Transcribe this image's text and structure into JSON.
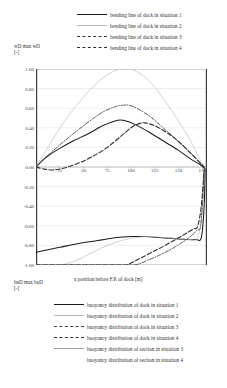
{
  "chart_data": {
    "type": "line",
    "title": "",
    "xlabel": "x position before F.P. of dock [m]",
    "ylabel_top": "wD/max wD [-]",
    "ylabel_bottom": "buD/max buD [-]",
    "xlim": [
      0,
      180
    ],
    "ylim": [
      -1.0,
      1.0
    ],
    "grid": true,
    "xticks": [
      25,
      50,
      75,
      100,
      125,
      150,
      175
    ],
    "yticks": [
      1.0,
      0.8,
      0.6,
      0.4,
      0.2,
      0.0,
      -0.2,
      -0.4,
      -0.6,
      -0.8,
      -1.0
    ],
    "ytick_labels": [
      "1.00",
      "0.80",
      "0.60",
      "0.40",
      "0.20",
      "0.00",
      "-0.20",
      "-0.40",
      "-0.60",
      "-0.80",
      "-1.00"
    ],
    "xtick_labels": [
      "25",
      "50",
      "75",
      "100",
      "125",
      "150",
      "175"
    ],
    "series": [
      {
        "name": "bending line of dock in situation 1",
        "style": "solid",
        "color": "#1a1a1a",
        "x": [
          0,
          5,
          12,
          25,
          40,
          55,
          70,
          80,
          88,
          95,
          105,
          120,
          135,
          150,
          163,
          172,
          176,
          178
        ],
        "values": [
          0.0,
          0.05,
          0.11,
          0.19,
          0.27,
          0.34,
          0.42,
          0.46,
          0.48,
          0.47,
          0.43,
          0.35,
          0.26,
          0.17,
          0.08,
          0.03,
          0.0,
          -0.02
        ]
      },
      {
        "name": "bending line of dock in situation 2",
        "style": "thin",
        "color": "#bdbdbd",
        "x": [
          0,
          6,
          15,
          28,
          42,
          58,
          72,
          85,
          95,
          100,
          110,
          122,
          136,
          150,
          162,
          172,
          177
        ],
        "values": [
          0.0,
          0.1,
          0.24,
          0.44,
          0.62,
          0.8,
          0.92,
          0.99,
          1.0,
          1.0,
          0.95,
          0.85,
          0.67,
          0.47,
          0.28,
          0.09,
          0.0
        ]
      },
      {
        "name": "bending line of dock in situation 3",
        "style": "dashdot",
        "color": "#3b3b3b",
        "x": [
          0,
          6,
          15,
          28,
          42,
          58,
          72,
          85,
          92,
          98,
          108,
          122,
          136,
          150,
          163,
          172,
          177
        ],
        "values": [
          0.0,
          0.06,
          0.14,
          0.25,
          0.36,
          0.48,
          0.57,
          0.62,
          0.63,
          0.63,
          0.59,
          0.5,
          0.38,
          0.26,
          0.14,
          0.05,
          0.0
        ]
      },
      {
        "name": "bending line of dock in situation 4",
        "style": "dashed",
        "color": "#2e2e2e",
        "x": [
          0,
          8,
          18,
          30,
          45,
          60,
          75,
          90,
          100,
          108,
          115,
          125,
          138,
          150,
          163,
          172,
          177
        ],
        "values": [
          0.0,
          -0.02,
          -0.03,
          -0.01,
          0.04,
          0.11,
          0.2,
          0.32,
          0.4,
          0.44,
          0.45,
          0.42,
          0.35,
          0.26,
          0.14,
          0.05,
          0.0
        ]
      },
      {
        "name": "buoyancy distribution of dock in situation 1",
        "style": "solid",
        "color": "#1a1a1a",
        "x": [
          0,
          10,
          25,
          45,
          65,
          85,
          100,
          115,
          130,
          145,
          158,
          168,
          174,
          177,
          178
        ],
        "values": [
          -0.87,
          -0.85,
          -0.82,
          -0.78,
          -0.75,
          -0.72,
          -0.71,
          -0.71,
          -0.72,
          -0.73,
          -0.74,
          -0.74,
          -0.72,
          -0.4,
          -0.03
        ]
      },
      {
        "name": "buoyancy distribution of dock in situation 2",
        "style": "thin",
        "color": "#bdbdbd",
        "x": [
          0,
          12,
          25,
          38,
          50,
          62,
          75,
          90,
          105,
          120,
          135,
          150,
          162,
          170,
          175,
          177
        ],
        "values": [
          -1.0,
          -1.0,
          -1.0,
          -0.97,
          -0.92,
          -0.86,
          -0.8,
          -0.75,
          -0.72,
          -0.71,
          -0.72,
          -0.73,
          -0.74,
          -0.72,
          -0.45,
          -0.03
        ]
      },
      {
        "name": "buoyancy distribution of dock in situation 3",
        "style": "dashdot",
        "color": "#3b3b3b",
        "x": [
          0,
          40,
          80,
          100,
          108,
          118,
          130,
          142,
          152,
          160,
          166,
          170,
          173,
          175,
          177
        ],
        "values": [
          -1.0,
          -1.0,
          -1.0,
          -1.0,
          -0.99,
          -0.95,
          -0.9,
          -0.84,
          -0.78,
          -0.73,
          -0.68,
          -0.64,
          -0.62,
          -0.4,
          -0.03
        ]
      },
      {
        "name": "buoyancy distribution of dock in situation 4",
        "style": "dashed",
        "color": "#2e2e2e",
        "x": [
          0,
          40,
          80,
          95,
          100,
          110,
          122,
          134,
          145,
          154,
          161,
          166,
          170,
          174,
          177
        ],
        "values": [
          -1.0,
          -1.0,
          -1.0,
          -1.0,
          -0.98,
          -0.93,
          -0.87,
          -0.81,
          -0.75,
          -0.7,
          -0.66,
          -0.63,
          -0.61,
          -0.4,
          -0.03
        ]
      },
      {
        "name": "buoyancy distribution of section in situation 3",
        "style": "thin2",
        "color": "#a8a8a8",
        "x": [],
        "values": []
      },
      {
        "name": "buoyancy distribution of section in situation 4",
        "style": "none",
        "color": "#a8a8a8",
        "x": [],
        "values": []
      }
    ]
  },
  "legend_top": {
    "items": [
      {
        "label": "bending line of dock in situation 1",
        "style": "solid"
      },
      {
        "label": "bending line of dock in situation 2",
        "style": "thin"
      },
      {
        "label": "bending line of dock in situation 3",
        "style": "dashdot"
      },
      {
        "label": "bending line of dock in situation 4",
        "style": "dashed"
      }
    ]
  },
  "legend_bottom": {
    "items": [
      {
        "label": "buoyancy distribution of dock in situation 1",
        "style": "solid"
      },
      {
        "label": "buoyancy distribution of dock in situation 2",
        "style": "thin"
      },
      {
        "label": "buoyancy distribution of dock in situation 3",
        "style": "dashdot"
      },
      {
        "label": "buoyancy distribution of dock in situation 4",
        "style": "dashed"
      },
      {
        "label": "buoyancy distribution of section in situation 3",
        "style": "thin2"
      },
      {
        "label": "buoyancy distribution of section in situation 4",
        "style": "none"
      }
    ]
  },
  "axis_titles": {
    "y_top": "wD max wD",
    "y_top_unit": "[-]",
    "y_bottom": "buD max buD",
    "y_bottom_unit": "[-]",
    "x": "x position before F.P. of dock [m]"
  }
}
